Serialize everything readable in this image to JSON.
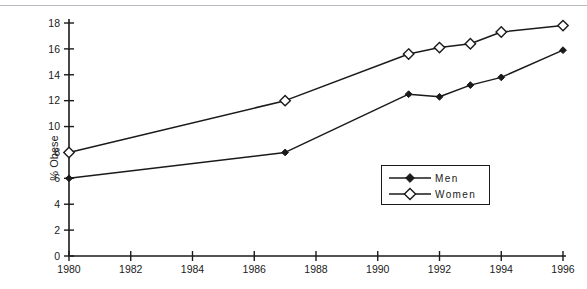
{
  "figure": {
    "top_rule_color": "#b9bcc0",
    "caption": "",
    "ylabel": "% Obese"
  },
  "legend": {
    "position": "inside-lower-right",
    "items": [
      {
        "label": "Men",
        "marker": "filled-diamond"
      },
      {
        "label": "Women",
        "marker": "open-diamond"
      }
    ]
  },
  "chart_data": {
    "type": "line",
    "title": "",
    "xlabel": "",
    "ylabel": "% Obese",
    "xlim": [
      1980,
      1996
    ],
    "ylim": [
      0,
      18
    ],
    "xticks": [
      1980,
      1982,
      1984,
      1986,
      1988,
      1990,
      1992,
      1994,
      1996
    ],
    "yticks": [
      0,
      2,
      4,
      6,
      8,
      10,
      12,
      14,
      16,
      18
    ],
    "grid": false,
    "legend_position": "lower right",
    "series": [
      {
        "name": "Men",
        "marker": "filled-diamond",
        "color": "#1a1a1a",
        "x": [
          1980,
          1987,
          1991,
          1992,
          1993,
          1994,
          1996
        ],
        "values": [
          6.0,
          8.0,
          12.5,
          12.3,
          13.2,
          13.8,
          15.9
        ]
      },
      {
        "name": "Women",
        "marker": "open-diamond",
        "color": "#1a1a1a",
        "x": [
          1980,
          1987,
          1991,
          1992,
          1993,
          1994,
          1996
        ],
        "values": [
          8.0,
          12.0,
          15.6,
          16.1,
          16.4,
          17.3,
          17.8
        ]
      }
    ]
  }
}
